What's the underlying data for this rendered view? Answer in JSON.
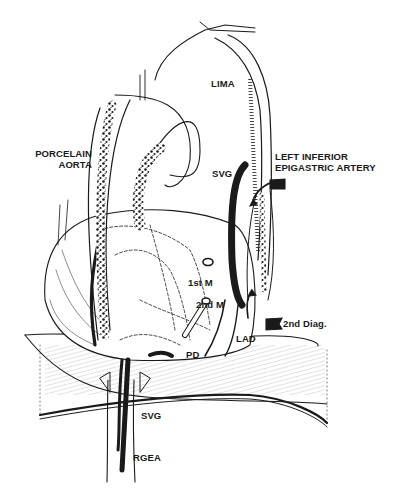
{
  "figure": {
    "type": "surgical illustration",
    "colors": {
      "ink": "#1a1a1a",
      "background": "#ffffff"
    }
  },
  "labels": {
    "lima": "LIMA",
    "porcelain_aorta_line1": "PORCELAIN",
    "porcelain_aorta_line2": "AORTA",
    "svg_upper": "SVG",
    "liea_line1": "LEFT INFERIOR",
    "liea_line2": "EPIGASTRIC ARTERY",
    "first_marginal": "1st M",
    "second_marginal": "2nd M",
    "second_diag": "2nd Diag.",
    "lad": "LAD",
    "pd": "PD",
    "svg_lower": "SVG",
    "rgea": "RGEA"
  }
}
